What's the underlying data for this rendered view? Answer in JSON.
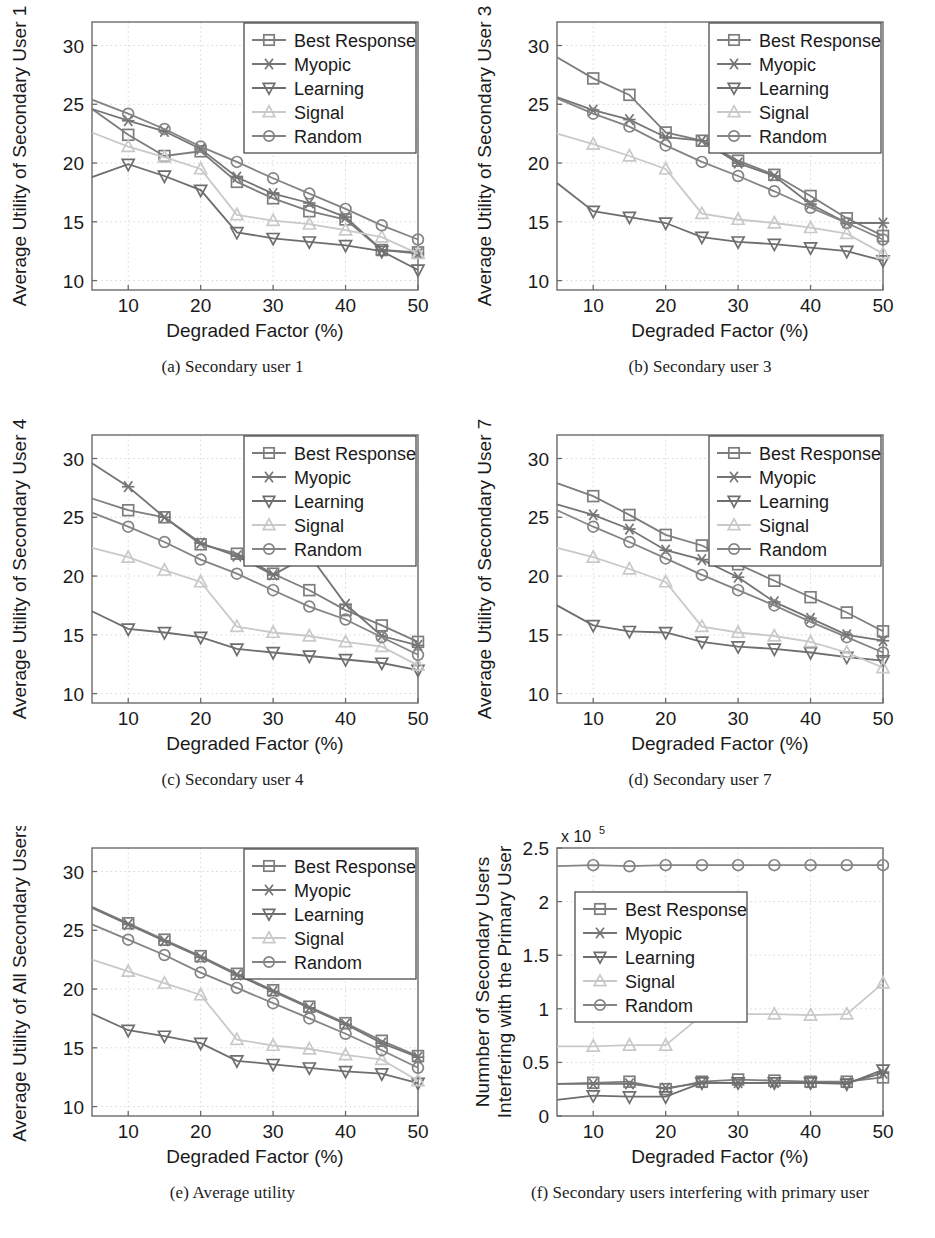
{
  "figure": {
    "series_names": [
      "Best Response",
      "Myopic",
      "Learning",
      "Signal",
      "Random"
    ],
    "series_markers": [
      "square-marker",
      "asterisk-marker",
      "triangle-down-marker",
      "triangle-up-marker",
      "circle-marker"
    ],
    "series_colors": [
      "#7d7d7d",
      "#757575",
      "#6e6e6e",
      "#c9c9c9",
      "#848484"
    ],
    "grid_color": "#d9d9d9",
    "axis_color": "#6b6b6b",
    "xlabel": "Degraded Factor (%)",
    "xticks": [
      10,
      20,
      30,
      40,
      50
    ],
    "xlim": [
      5,
      50
    ],
    "utility_yticks": [
      10,
      15,
      20,
      25,
      30
    ],
    "utility_ylim": [
      9.2,
      32
    ],
    "x": [
      5,
      10,
      15,
      20,
      25,
      30,
      35,
      40,
      45,
      50
    ]
  },
  "panels": [
    {
      "id": "a",
      "caption": "(a)  Secondary user 1",
      "ylabel": "Average Utility of Secondary User 1",
      "chart_data": {
        "type": "line",
        "title": "Secondary user 1",
        "xlabel": "Degraded Factor (%)",
        "ylabel": "Average Utility of Secondary User 1",
        "xlim": [
          5,
          50
        ],
        "ylim": [
          9.2,
          32
        ],
        "xticks": [
          10,
          20,
          30,
          40,
          50
        ],
        "yticks": [
          10,
          15,
          20,
          25,
          30
        ],
        "grid": true,
        "legend_position": "top-right",
        "x": [
          5,
          10,
          15,
          20,
          25,
          30,
          35,
          40,
          45,
          50
        ],
        "series": [
          {
            "name": "Best Response",
            "values": [
              24.6,
              22.4,
              20.6,
              21.0,
              18.4,
              17.0,
              15.9,
              15.2,
              12.6,
              12.4
            ]
          },
          {
            "name": "Myopic",
            "values": [
              24.6,
              23.6,
              22.7,
              21.2,
              18.8,
              17.4,
              16.6,
              15.4,
              12.6,
              12.3
            ]
          },
          {
            "name": "Learning",
            "values": [
              18.8,
              19.9,
              18.9,
              17.7,
              14.1,
              13.6,
              13.3,
              13.0,
              12.5,
              10.9
            ]
          },
          {
            "name": "Signal",
            "values": [
              22.6,
              21.4,
              20.5,
              19.5,
              15.6,
              15.1,
              14.8,
              14.3,
              13.7,
              12.3
            ]
          },
          {
            "name": "Random",
            "values": [
              25.4,
              24.2,
              22.9,
              21.4,
              20.1,
              18.7,
              17.4,
              16.1,
              14.7,
              13.5
            ]
          }
        ]
      }
    },
    {
      "id": "b",
      "caption": "(b)  Secondary user 3",
      "ylabel": "Average Utility of Secondary User 3",
      "chart_data": {
        "type": "line",
        "title": "Secondary user 3",
        "xlabel": "Degraded Factor (%)",
        "ylabel": "Average Utility of Secondary User 3",
        "xlim": [
          5,
          50
        ],
        "ylim": [
          9.2,
          32
        ],
        "xticks": [
          10,
          20,
          30,
          40,
          50
        ],
        "yticks": [
          10,
          15,
          20,
          25,
          30
        ],
        "grid": true,
        "legend_position": "top-right",
        "x": [
          5,
          10,
          15,
          20,
          25,
          30,
          35,
          40,
          45,
          50
        ],
        "series": [
          {
            "name": "Best Response",
            "values": [
              29.0,
              27.2,
              25.8,
              22.6,
              21.9,
              20.2,
              19.0,
              17.2,
              15.3,
              13.8
            ]
          },
          {
            "name": "Myopic",
            "values": [
              25.6,
              24.5,
              23.7,
              22.2,
              21.9,
              20.0,
              18.9,
              16.5,
              14.9,
              14.9
            ]
          },
          {
            "name": "Learning",
            "values": [
              18.3,
              15.9,
              15.4,
              14.9,
              13.7,
              13.3,
              13.1,
              12.8,
              12.5,
              11.7
            ]
          },
          {
            "name": "Signal",
            "values": [
              22.5,
              21.6,
              20.6,
              19.5,
              15.7,
              15.2,
              14.9,
              14.5,
              14.0,
              12.3
            ]
          },
          {
            "name": "Random",
            "values": [
              25.5,
              24.2,
              23.1,
              21.5,
              20.1,
              18.9,
              17.6,
              16.2,
              14.9,
              13.5
            ]
          }
        ]
      }
    },
    {
      "id": "c",
      "caption": "(c)  Secondary user 4",
      "ylabel": "Average Utility of Secondary User 4",
      "chart_data": {
        "type": "line",
        "title": "Secondary user 4",
        "xlabel": "Degraded Factor (%)",
        "ylabel": "Average Utility of Secondary User 4",
        "xlim": [
          5,
          50
        ],
        "ylim": [
          9.2,
          32
        ],
        "xticks": [
          10,
          20,
          30,
          40,
          50
        ],
        "yticks": [
          10,
          15,
          20,
          25,
          30
        ],
        "grid": true,
        "legend_position": "top-right",
        "x": [
          5,
          10,
          15,
          20,
          25,
          30,
          35,
          40,
          45,
          50
        ],
        "series": [
          {
            "name": "Best Response",
            "values": [
              26.6,
              25.6,
              25.0,
              22.7,
              21.9,
              20.2,
              18.8,
              17.1,
              15.8,
              14.4
            ]
          },
          {
            "name": "Myopic",
            "values": [
              29.6,
              27.6,
              25.0,
              22.8,
              21.7,
              20.1,
              21.8,
              17.6,
              14.9,
              14.1
            ]
          },
          {
            "name": "Learning",
            "values": [
              17.0,
              15.5,
              15.2,
              14.8,
              13.8,
              13.5,
              13.2,
              12.9,
              12.6,
              12.0
            ]
          },
          {
            "name": "Signal",
            "values": [
              22.4,
              21.6,
              20.5,
              19.5,
              15.7,
              15.2,
              14.9,
              14.4,
              14.0,
              12.4
            ]
          },
          {
            "name": "Random",
            "values": [
              25.4,
              24.2,
              22.9,
              21.4,
              20.2,
              18.8,
              17.4,
              16.3,
              14.8,
              13.3
            ]
          }
        ]
      }
    },
    {
      "id": "d",
      "caption": "(d)  Secondary user 7",
      "ylabel": "Average Utility of Secondary User 7",
      "chart_data": {
        "type": "line",
        "title": "Secondary user 7",
        "xlabel": "Degraded Factor (%)",
        "ylabel": "Average Utility of Secondary User 7",
        "xlim": [
          5,
          50
        ],
        "ylim": [
          9.2,
          32
        ],
        "xticks": [
          10,
          20,
          30,
          40,
          50
        ],
        "yticks": [
          10,
          15,
          20,
          25,
          30
        ],
        "grid": true,
        "legend_position": "top-right",
        "x": [
          5,
          10,
          15,
          20,
          25,
          30,
          35,
          40,
          45,
          50
        ],
        "series": [
          {
            "name": "Best Response",
            "values": [
              27.9,
              26.8,
              25.2,
              23.5,
              22.6,
              21.0,
              19.6,
              18.2,
              16.9,
              15.3
            ]
          },
          {
            "name": "Myopic",
            "values": [
              26.1,
              25.2,
              24.0,
              22.2,
              21.4,
              19.9,
              17.8,
              16.4,
              15.0,
              14.5
            ]
          },
          {
            "name": "Learning",
            "values": [
              17.5,
              15.8,
              15.3,
              15.2,
              14.4,
              14.0,
              13.8,
              13.5,
              13.1,
              12.8
            ]
          },
          {
            "name": "Signal",
            "values": [
              22.4,
              21.6,
              20.6,
              19.5,
              15.7,
              15.2,
              14.9,
              14.4,
              13.5,
              12.2
            ]
          },
          {
            "name": "Random",
            "values": [
              25.6,
              24.2,
              22.9,
              21.5,
              20.1,
              18.8,
              17.5,
              16.1,
              14.8,
              13.5
            ]
          }
        ]
      }
    },
    {
      "id": "e",
      "caption": "(e)  Average utility",
      "ylabel": "Average Utility of All Secondary Users",
      "chart_data": {
        "type": "line",
        "title": "Average utility",
        "xlabel": "Degraded Factor (%)",
        "ylabel": "Average Utility of All Secondary Users",
        "xlim": [
          5,
          50
        ],
        "ylim": [
          9.2,
          32
        ],
        "xticks": [
          10,
          20,
          30,
          40,
          50
        ],
        "yticks": [
          10,
          15,
          20,
          25,
          30
        ],
        "grid": true,
        "legend_position": "top-right",
        "x": [
          5,
          10,
          15,
          20,
          25,
          30,
          35,
          40,
          45,
          50
        ],
        "series": [
          {
            "name": "Best Response",
            "values": [
              27.0,
              25.6,
              24.2,
              22.8,
              21.3,
              19.9,
              18.5,
              17.1,
              15.6,
              14.3
            ]
          },
          {
            "name": "Myopic",
            "values": [
              26.9,
              25.5,
              24.1,
              22.7,
              21.2,
              19.8,
              18.4,
              17.0,
              15.4,
              14.2
            ]
          },
          {
            "name": "Learning",
            "values": [
              17.9,
              16.5,
              16.0,
              15.4,
              13.9,
              13.6,
              13.3,
              13.0,
              12.8,
              12.0
            ]
          },
          {
            "name": "Signal",
            "values": [
              22.5,
              21.5,
              20.5,
              19.5,
              15.7,
              15.2,
              14.9,
              14.4,
              14.0,
              12.2
            ]
          },
          {
            "name": "Random",
            "values": [
              25.5,
              24.2,
              22.9,
              21.4,
              20.1,
              18.8,
              17.5,
              16.2,
              14.8,
              13.3
            ]
          }
        ]
      }
    },
    {
      "id": "f",
      "caption": "(f)  Secondary users interfering with primary user",
      "ylabel": "Numnber of Secondary Users\nInterfering with the Primary User",
      "ylabel_line1": "Numnber of Secondary Users",
      "ylabel_line2": "Interfering with the Primary User",
      "exponent_base": "x 10",
      "exponent_power": "5",
      "chart_data": {
        "type": "line",
        "title": "Secondary users interfering with primary user",
        "xlabel": "Degraded Factor (%)",
        "ylabel": "Numnber of Secondary Users Interfering with the Primary User",
        "y_scale_note": "x 10^5",
        "xlim": [
          5,
          50
        ],
        "ylim": [
          0,
          2.5
        ],
        "xticks": [
          10,
          20,
          30,
          40,
          50
        ],
        "yticks": [
          0,
          0.5,
          1,
          1.5,
          2,
          2.5
        ],
        "grid": true,
        "legend_position": "upper-left",
        "x": [
          5,
          10,
          15,
          20,
          25,
          30,
          35,
          40,
          45,
          50
        ],
        "series": [
          {
            "name": "Best Response",
            "values": [
              0.3,
              0.31,
              0.32,
              0.25,
              0.32,
              0.34,
              0.33,
              0.32,
              0.32,
              0.36
            ]
          },
          {
            "name": "Myopic",
            "values": [
              0.3,
              0.3,
              0.3,
              0.26,
              0.31,
              0.31,
              0.31,
              0.31,
              0.31,
              0.4
            ]
          },
          {
            "name": "Learning",
            "values": [
              0.15,
              0.19,
              0.18,
              0.18,
              0.31,
              0.31,
              0.31,
              0.31,
              0.3,
              0.43
            ]
          },
          {
            "name": "Signal",
            "values": [
              0.65,
              0.65,
              0.66,
              0.66,
              0.94,
              0.95,
              0.95,
              0.94,
              0.95,
              1.24
            ]
          },
          {
            "name": "Random",
            "values": [
              2.33,
              2.34,
              2.33,
              2.34,
              2.34,
              2.34,
              2.34,
              2.34,
              2.34,
              2.34
            ]
          }
        ]
      }
    }
  ]
}
